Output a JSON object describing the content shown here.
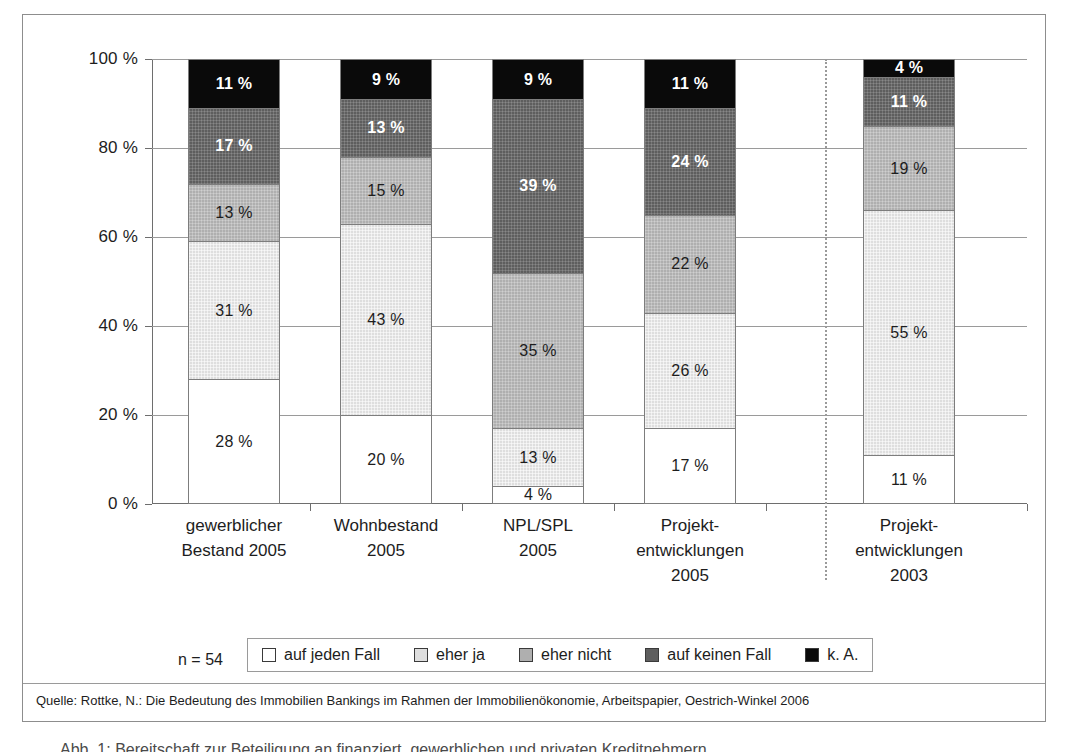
{
  "chart_data": {
    "type": "bar",
    "subtype": "stacked-100-percent-vertical",
    "title": "",
    "subtitle": "",
    "xlabel": "",
    "ylabel": "",
    "ylim": [
      0,
      100
    ],
    "y_unit": "%",
    "grid": true,
    "legend_position": "bottom",
    "categories": [
      "gewerblicher Bestand 2005",
      "Wohnbestand 2005",
      "NPL/SPL 2005",
      "Projektentwicklungen 2005",
      "Projektentwicklungen 2003"
    ],
    "category_lines": [
      [
        "gewerblicher",
        "Bestand 2005"
      ],
      [
        "Wohnbestand",
        "2005"
      ],
      [
        "NPL/SPL",
        "2005"
      ],
      [
        "Projekt-",
        "entwicklungen",
        "2005"
      ],
      [
        "Projekt-",
        "entwicklungen",
        "2003"
      ]
    ],
    "series": [
      {
        "name": "auf jeden Fall",
        "color": "#ffffff",
        "values": [
          28,
          20,
          4,
          17,
          11
        ]
      },
      {
        "name": "eher ja",
        "color": "#dedede",
        "values": [
          31,
          43,
          13,
          26,
          55
        ]
      },
      {
        "name": "eher nicht",
        "color": "#afafaf",
        "values": [
          13,
          15,
          35,
          22,
          19
        ]
      },
      {
        "name": "auf keinen Fall",
        "color": "#5e5e5e",
        "values": [
          17,
          13,
          39,
          24,
          11
        ]
      },
      {
        "name": "k. A.",
        "color": "#0a0a0a",
        "values": [
          11,
          9,
          9,
          11,
          4
        ]
      }
    ],
    "value_labels": [
      [
        "28 %",
        "31 %",
        "13 %",
        "17 %",
        "11 %"
      ],
      [
        "20 %",
        "43 %",
        "15 %",
        "13 %",
        "9 %"
      ],
      [
        "4 %",
        "13 %",
        "35 %",
        "39 %",
        "9 %"
      ],
      [
        "17 %",
        "26 %",
        "22 %",
        "24 %",
        "11 %"
      ],
      [
        "11 %",
        "55 %",
        "19 %",
        "11 %",
        "4 %"
      ]
    ],
    "y_ticks": [
      0,
      20,
      40,
      60,
      80,
      100
    ],
    "y_tick_labels": [
      "0 %",
      "20 %",
      "40 %",
      "60 %",
      "80 %",
      "100 %"
    ],
    "annotations": [
      "n = 54"
    ],
    "group_separator_after_category": 4
  },
  "legend": {
    "sample_note": "n = 54",
    "items": [
      {
        "label": "auf jeden Fall",
        "color": "#ffffff"
      },
      {
        "label": "eher ja",
        "color": "#dedede"
      },
      {
        "label": "eher nicht",
        "color": "#afafaf"
      },
      {
        "label": "auf keinen Fall",
        "color": "#5e5e5e"
      },
      {
        "label": "k. A.",
        "color": "#0a0a0a"
      }
    ]
  },
  "source": {
    "text": "Quelle: Rottke, N.: Die Bedeutung des Immobilien Bankings im Rahmen der Immobilienökonomie, Arbeitspapier, Oestrich-Winkel 2006"
  },
  "caption": {
    "text": "Abb. 1:  Bereitschaft zur Beteiligung an finanziert, gewerblichen und privaten Kreditnehmern"
  }
}
